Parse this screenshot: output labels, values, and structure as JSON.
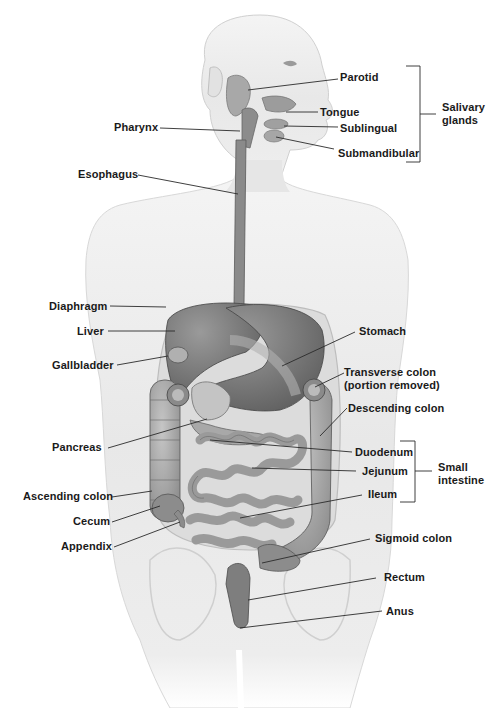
{
  "diagram": {
    "labels_left": [
      {
        "id": "pharynx",
        "text": "Pharynx"
      },
      {
        "id": "esophagus",
        "text": "Esophagus"
      },
      {
        "id": "diaphragm",
        "text": "Diaphragm"
      },
      {
        "id": "liver",
        "text": "Liver"
      },
      {
        "id": "gallbladder",
        "text": "Gallbladder"
      },
      {
        "id": "pancreas",
        "text": "Pancreas"
      },
      {
        "id": "ascending_colon",
        "text": "Ascending colon"
      },
      {
        "id": "cecum",
        "text": "Cecum"
      },
      {
        "id": "appendix",
        "text": "Appendix"
      }
    ],
    "labels_right": [
      {
        "id": "parotid",
        "text": "Parotid"
      },
      {
        "id": "tongue",
        "text": "Tongue"
      },
      {
        "id": "sublingual",
        "text": "Sublingual"
      },
      {
        "id": "submandibular",
        "text": "Submandibular"
      },
      {
        "id": "stomach",
        "text": "Stomach"
      },
      {
        "id": "transverse_colon",
        "text": "Transverse colon",
        "text2": "(portion removed)"
      },
      {
        "id": "descending_colon",
        "text": "Descending colon"
      },
      {
        "id": "duodenum",
        "text": "Duodenum"
      },
      {
        "id": "jejunum",
        "text": "Jejunum"
      },
      {
        "id": "ileum",
        "text": "Ileum"
      },
      {
        "id": "sigmoid_colon",
        "text": "Sigmoid colon"
      },
      {
        "id": "rectum",
        "text": "Rectum"
      },
      {
        "id": "anus",
        "text": "Anus"
      }
    ],
    "groups": [
      {
        "id": "salivary_glands",
        "line1": "Salivary",
        "line2": "glands",
        "members": [
          "Parotid",
          "Tongue",
          "Sublingual",
          "Submandibular"
        ]
      },
      {
        "id": "small_intestine",
        "line1": "Small",
        "line2": "intestine",
        "members": [
          "Duodenum",
          "Jejunum",
          "Ileum"
        ]
      }
    ],
    "colors": {
      "skin": "#ededed",
      "skin_edge": "#c9c9c9",
      "organ_dark": "#6e6e6e",
      "organ_mid": "#8f8f8f",
      "organ_light": "#b5b5b5",
      "leader": "#2a2a2a",
      "text": "#1a1a1a"
    }
  }
}
